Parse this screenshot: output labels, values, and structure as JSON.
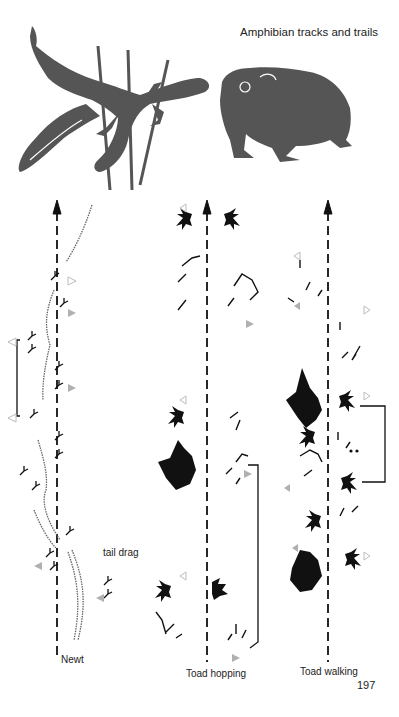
{
  "page": {
    "title": "Amphibian tracks and trails",
    "page_number": "197"
  },
  "illustration": {
    "subjects": [
      "newt",
      "toad"
    ],
    "color": "#555555"
  },
  "tracks": [
    {
      "id": "newt",
      "label": "Newt",
      "annotation": "tail drag"
    },
    {
      "id": "toad-hopping",
      "label": "Toad hopping"
    },
    {
      "id": "toad-walking",
      "label": "Toad walking"
    }
  ],
  "colors": {
    "ink": "#111111",
    "marker_filled": "#b0b0b0",
    "marker_outline": "#c0c0c0",
    "stipple": "#888888"
  }
}
